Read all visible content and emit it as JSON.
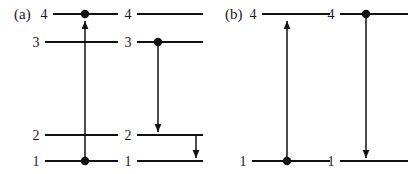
{
  "figure": {
    "type": "energy-level-diagram",
    "width": 415,
    "height": 174,
    "background_color": "#ffffff",
    "ink_color": "#111111"
  },
  "panels": [
    {
      "id": "a",
      "label": "(a)",
      "label_x": 14,
      "label_y": 19,
      "subpanels": [
        {
          "id": "a-left",
          "levels": [
            {
              "label": "4",
              "n": 4,
              "y": 14,
              "x1": 53,
              "x2": 118,
              "label_x": 44,
              "label_y": 19
            },
            {
              "label": "3",
              "n": 3,
              "y": 42,
              "x1": 45,
              "x2": 118,
              "label_x": 36,
              "label_y": 47
            },
            {
              "label": "2",
              "n": 2,
              "y": 135,
              "x1": 45,
              "x2": 118,
              "label_x": 36,
              "label_y": 140
            },
            {
              "label": "1",
              "n": 1,
              "y": 161,
              "x1": 45,
              "x2": 118,
              "label_x": 36,
              "label_y": 166
            }
          ],
          "dots": [
            {
              "on_level": 4,
              "x": 85,
              "y": 14,
              "r": 4.2
            },
            {
              "on_level": 1,
              "x": 85,
              "y": 161,
              "r": 4.2
            }
          ],
          "arrows": [
            {
              "name": "excitation-1-to-4",
              "from_level": 1,
              "to_level": 4,
              "direction": "up",
              "x": 85,
              "y_start": 163,
              "y_end": 21
            }
          ]
        },
        {
          "id": "a-right",
          "levels": [
            {
              "label": "4",
              "n": 4,
              "y": 14,
              "x1": 137,
              "x2": 203,
              "label_x": 128,
              "label_y": 19
            },
            {
              "label": "3",
              "n": 3,
              "y": 42,
              "x1": 137,
              "x2": 203,
              "label_x": 128,
              "label_y": 47
            },
            {
              "label": "2",
              "n": 2,
              "y": 135,
              "x1": 137,
              "x2": 203,
              "label_x": 128,
              "label_y": 140
            },
            {
              "label": "1",
              "n": 1,
              "y": 161,
              "x1": 137,
              "x2": 203,
              "label_x": 128,
              "label_y": 166
            }
          ],
          "dots": [
            {
              "on_level": 3,
              "x": 158,
              "y": 42,
              "r": 4.2
            }
          ],
          "arrows": [
            {
              "name": "decay-3-to-2",
              "from_level": 3,
              "to_level": 2,
              "direction": "down",
              "x": 158,
              "y_start": 45,
              "y_end": 132
            },
            {
              "name": "decay-2-to-1",
              "from_level": 2,
              "to_level": 1,
              "direction": "down",
              "x": 196,
              "y_start": 136,
              "y_end": 158
            }
          ]
        }
      ]
    },
    {
      "id": "b",
      "label": "(b)",
      "label_x": 225,
      "label_y": 19,
      "subpanels": [
        {
          "id": "b-left",
          "levels": [
            {
              "label": "4",
              "n": 4,
              "y": 14,
              "x1": 262,
              "x2": 330,
              "label_x": 253,
              "label_y": 19
            },
            {
              "label": "1",
              "n": 1,
              "y": 161,
              "x1": 252,
              "x2": 330,
              "label_x": 243,
              "label_y": 166
            }
          ],
          "dots": [
            {
              "on_level": 1,
              "x": 287,
              "y": 161,
              "r": 4.2
            }
          ],
          "arrows": [
            {
              "name": "excitation-1-to-4",
              "from_level": 1,
              "to_level": 4,
              "direction": "up",
              "x": 287,
              "y_start": 163,
              "y_end": 21
            }
          ]
        },
        {
          "id": "b-right",
          "levels": [
            {
              "label": "4",
              "n": 4,
              "y": 14,
              "x1": 340,
              "x2": 408,
              "label_x": 331,
              "label_y": 19
            },
            {
              "label": "1",
              "n": 1,
              "y": 161,
              "x1": 340,
              "x2": 408,
              "label_x": 331,
              "label_y": 166
            }
          ],
          "dots": [
            {
              "on_level": 4,
              "x": 366,
              "y": 14,
              "r": 4.2
            }
          ],
          "arrows": [
            {
              "name": "decay-4-to-1",
              "from_level": 4,
              "to_level": 1,
              "direction": "down",
              "x": 366,
              "y_start": 17,
              "y_end": 158
            }
          ]
        }
      ]
    }
  ]
}
